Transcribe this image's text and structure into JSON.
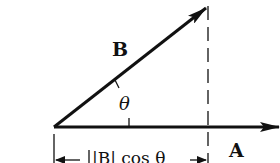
{
  "diagram": {
    "vector_b_label": "B",
    "vector_a_label": "A",
    "angle_label": "θ",
    "projection_label": "|B| cos θ",
    "colors": {
      "stroke": "#111111",
      "background": "#ffffff"
    }
  }
}
